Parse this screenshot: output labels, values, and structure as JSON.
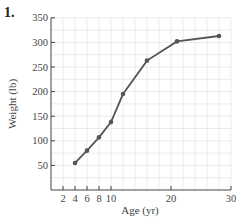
{
  "problem_number": "1.",
  "chart_data": {
    "type": "line",
    "title": "",
    "xlabel": "Age (yr)",
    "ylabel": "Weight (lb)",
    "x": [
      4,
      6,
      8,
      10,
      12,
      16,
      21,
      28
    ],
    "series": [
      {
        "name": "Weight",
        "values": [
          55,
          80,
          107,
          138,
          195,
          263,
          302,
          313
        ]
      }
    ],
    "xlim": [
      0,
      30
    ],
    "ylim": [
      0,
      350
    ],
    "xticks": [
      2,
      4,
      6,
      8,
      10,
      20,
      30
    ],
    "yticks": [
      50,
      100,
      150,
      200,
      250,
      300,
      350
    ],
    "grid": true,
    "legend": "none"
  },
  "colors": {
    "line": "#555555",
    "grid": "#e6e6e6",
    "axis": "#444444"
  }
}
